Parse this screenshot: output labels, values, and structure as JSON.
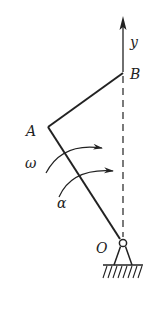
{
  "diagram": {
    "labels": {
      "y": "y",
      "B": "B",
      "A": "A",
      "O": "O",
      "omega": "ω",
      "alpha": "α"
    },
    "colors": {
      "line": "#222222",
      "background": "#ffffff"
    }
  }
}
